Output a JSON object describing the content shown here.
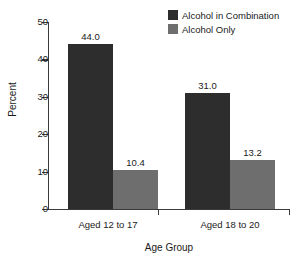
{
  "chart_data": {
    "type": "bar",
    "title": "",
    "xlabel": "Age Group",
    "ylabel": "Percent",
    "categories": [
      "Aged 12 to 17",
      "Aged 18 to 20"
    ],
    "series": [
      {
        "name": "Alcohol in Combination",
        "color": "#2d2d2d",
        "values": [
          44.0,
          31.0
        ],
        "labels": [
          "44.0",
          "31.0"
        ]
      },
      {
        "name": "Alcohol Only",
        "color": "#6e6e6e",
        "values": [
          10.4,
          13.2
        ],
        "labels": [
          "10.4",
          "13.2"
        ]
      }
    ],
    "ylim": [
      0,
      50
    ],
    "yticks": [
      0,
      10,
      20,
      30,
      40,
      50
    ],
    "ytick_labels": [
      "0",
      "10",
      "20",
      "30",
      "40",
      "50"
    ],
    "grid": false,
    "legend_position": "top-right"
  },
  "legend": {
    "entries": [
      {
        "label": "Alcohol in Combination",
        "color": "#2d2d2d"
      },
      {
        "label": "Alcohol Only",
        "color": "#6e6e6e"
      }
    ]
  },
  "axes": {
    "y_title": "Percent",
    "x_title": "Age Group",
    "y_labels": [
      "50",
      "40",
      "30",
      "20",
      "10",
      "0"
    ]
  },
  "categories": {
    "items": [
      {
        "label": "Aged 12 to 17"
      },
      {
        "label": "Aged 18 to 20"
      }
    ]
  },
  "bars": {
    "g1s1": "44.0",
    "g1s2": "10.4",
    "g2s1": "31.0",
    "g2s2": "13.2"
  }
}
